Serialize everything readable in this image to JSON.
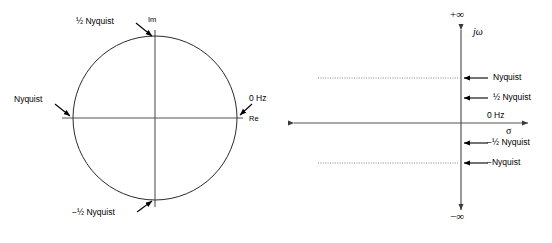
{
  "figure": {
    "width": 552,
    "height": 243,
    "background": "#ffffff",
    "line_color": "#3a3a3a",
    "stroke_color": "#000000"
  },
  "z_plane": {
    "name": "z-plane unit circle",
    "circle": {
      "cx": 155,
      "cy": 118,
      "r": 82
    },
    "axes": {
      "real_label": "Re",
      "imag_label": "Im",
      "real_axis_y": 118,
      "imag_axis_x": 155
    },
    "annotations": [
      {
        "id": "half-nyquist-top",
        "text": "½ Nyquist",
        "point": "top",
        "x": 150,
        "y": 37
      },
      {
        "id": "zero-hz",
        "text": "0 Hz",
        "point": "right",
        "x": 237,
        "y": 118
      },
      {
        "id": "nyquist-left",
        "text": "Nyquist",
        "point": "left",
        "x": 73,
        "y": 118
      },
      {
        "id": "neg-half-nyquist-bottom",
        "text": "−½ Nyquist",
        "point": "bottom",
        "x": 155,
        "y": 200
      }
    ]
  },
  "s_plane": {
    "name": "s-plane",
    "axes": {
      "sigma_label": "σ",
      "jomega_label": "jω",
      "sigma_axis_y": 123,
      "jomega_axis_x": 461,
      "top_infinity": "+∞",
      "bottom_infinity": "−∞"
    },
    "markers": [
      {
        "id": "nyquist-pos",
        "text": "Nyquist",
        "y": 78,
        "dotted": true
      },
      {
        "id": "half-nyquist-pos",
        "text": "½ Nyquist",
        "y": 98,
        "dotted": false
      },
      {
        "id": "zero-hz",
        "text": "0 Hz",
        "y": 117,
        "dotted": false
      },
      {
        "id": "half-nyquist-neg",
        "text": "−½ Nyquist",
        "y": 143,
        "dotted": false
      },
      {
        "id": "nyquist-neg",
        "text": "−Nyquist",
        "y": 163,
        "dotted": true
      }
    ]
  }
}
